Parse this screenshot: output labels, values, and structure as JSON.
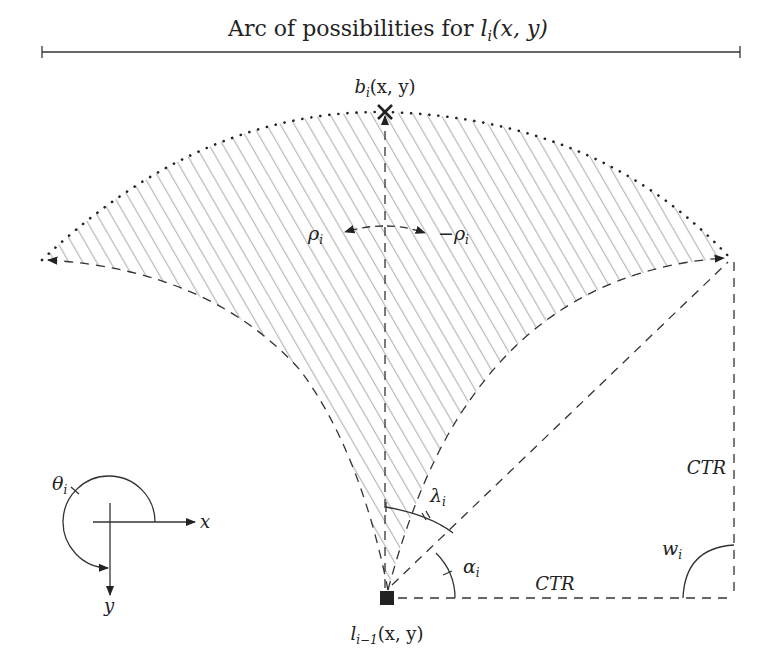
{
  "title": {
    "prefix": "Arc of possibilities for ",
    "math": "l",
    "sub": "i",
    "args": "(x, y)"
  },
  "labels": {
    "top_point": {
      "base": "b",
      "sub": "i",
      "args": "(x, y)"
    },
    "origin_point": {
      "base": "l",
      "sub": "i−1",
      "args": "(x, y)"
    },
    "rho_left": {
      "base": "ρ",
      "sub": "i"
    },
    "rho_right": {
      "prefix": "−",
      "base": "ρ",
      "sub": "i"
    },
    "lambda": {
      "base": "λ",
      "sub": "i"
    },
    "alpha": {
      "base": "α",
      "sub": "i"
    },
    "omega": {
      "base": "w",
      "sub": "i"
    },
    "ctr_vertical": "CTR",
    "ctr_horizontal": "CTR",
    "theta": {
      "base": "θ",
      "sub": "i"
    },
    "axis_x": "x",
    "axis_y": "y"
  },
  "colors": {
    "line": "#333333",
    "hatch": "#b8b8b8",
    "text": "#222222"
  }
}
